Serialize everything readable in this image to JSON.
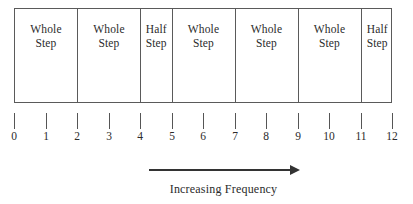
{
  "diagram": {
    "bar": {
      "start_unit": 0,
      "end_unit": 12,
      "segments": [
        {
          "label": "Whole\nStep",
          "type": "whole-step",
          "start": 0,
          "end": 2,
          "span": 2
        },
        {
          "label": "Whole\nStep",
          "type": "whole-step",
          "start": 2,
          "end": 4,
          "span": 2
        },
        {
          "label": "Half\nStep",
          "type": "half-step",
          "start": 4,
          "end": 5,
          "span": 1
        },
        {
          "label": "Whole\nStep",
          "type": "whole-step",
          "start": 5,
          "end": 7,
          "span": 2
        },
        {
          "label": "Whole\nStep",
          "type": "whole-step",
          "start": 7,
          "end": 9,
          "span": 2
        },
        {
          "label": "Whole\nStep",
          "type": "whole-step",
          "start": 9,
          "end": 11,
          "span": 2
        },
        {
          "label": "Half\nStep",
          "type": "half-step",
          "start": 11,
          "end": 12,
          "span": 1
        }
      ]
    },
    "scale": {
      "ticks": [
        {
          "value": 0,
          "label": "0"
        },
        {
          "value": 1,
          "label": "1"
        },
        {
          "value": 2,
          "label": "2"
        },
        {
          "value": 3,
          "label": "3"
        },
        {
          "value": 4,
          "label": "4"
        },
        {
          "value": 5,
          "label": "5"
        },
        {
          "value": 6,
          "label": "6"
        },
        {
          "value": 7,
          "label": "7"
        },
        {
          "value": 8,
          "label": "8"
        },
        {
          "value": 9,
          "label": "9"
        },
        {
          "value": 10,
          "label": "10"
        },
        {
          "value": 11,
          "label": "11"
        },
        {
          "value": 12,
          "label": "12"
        }
      ]
    },
    "arrow": {
      "caption": "Increasing Frequency",
      "direction": "right"
    },
    "colors": {
      "line": "#5a5a5a",
      "text": "#2b2b2b",
      "arrow": "#333333",
      "background": "#ffffff"
    }
  }
}
